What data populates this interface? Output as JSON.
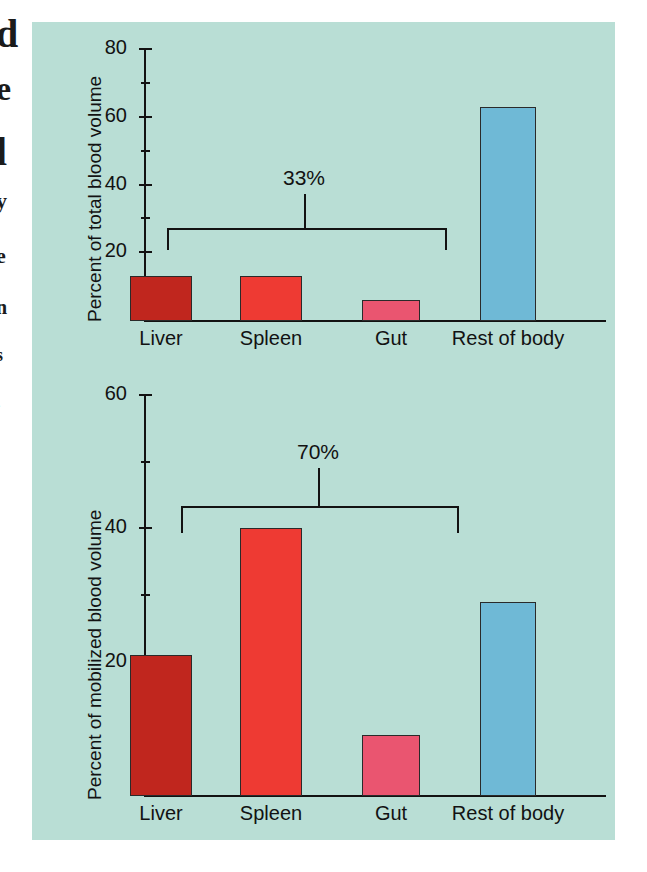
{
  "page": {
    "background_color": "#ffffff",
    "panel_color": "#b9ded5",
    "ink_color": "#121212"
  },
  "edge_bleed": {
    "fragments": [
      "d",
      "e",
      "l",
      "y",
      "e",
      "n",
      "s",
      "."
    ]
  },
  "palette": {
    "liver": "#c0261e",
    "spleen": "#ee3a33",
    "gut": "#ea5570",
    "rest_of_body": "#6fb9d6",
    "outline": "#2a2a2a"
  },
  "chart_data": [
    {
      "id": "top",
      "type": "bar",
      "title": "",
      "xlabel": "",
      "ylabel": "Percent of total blood volume",
      "categories": [
        "Liver",
        "Spleen",
        "Gut",
        "Rest of body"
      ],
      "values": [
        13,
        13,
        6,
        63
      ],
      "colors": [
        "#c0261e",
        "#ee3a33",
        "#ea5570",
        "#6fb9d6"
      ],
      "ylim": [
        0,
        80
      ],
      "y_major_ticks": [
        20,
        40,
        60,
        80
      ],
      "y_minor_ticks": [
        10,
        30,
        50,
        70
      ],
      "y_tick_labels": [
        "20",
        "40",
        "60",
        "80"
      ],
      "grid": false,
      "legend": "none",
      "annotations": [
        {
          "type": "bracket",
          "label": "33%",
          "spans": [
            "Liver",
            "Spleen",
            "Gut"
          ],
          "value": 33
        }
      ]
    },
    {
      "id": "bottom",
      "type": "bar",
      "title": "",
      "xlabel": "",
      "ylabel": "Percent of mobilized blood volume",
      "categories": [
        "Liver",
        "Spleen",
        "Gut",
        "Rest of body"
      ],
      "values": [
        21,
        40,
        9,
        29
      ],
      "colors": [
        "#c0261e",
        "#ee3a33",
        "#ea5570",
        "#6fb9d6"
      ],
      "ylim": [
        0,
        60
      ],
      "y_major_ticks": [
        20,
        40,
        60
      ],
      "y_minor_ticks": [
        10,
        30,
        50
      ],
      "y_tick_labels": [
        "20",
        "40",
        "60"
      ],
      "grid": false,
      "legend": "none",
      "annotations": [
        {
          "type": "bracket",
          "label": "70%",
          "spans": [
            "Liver",
            "Spleen",
            "Gut"
          ],
          "value": 70
        }
      ]
    }
  ]
}
